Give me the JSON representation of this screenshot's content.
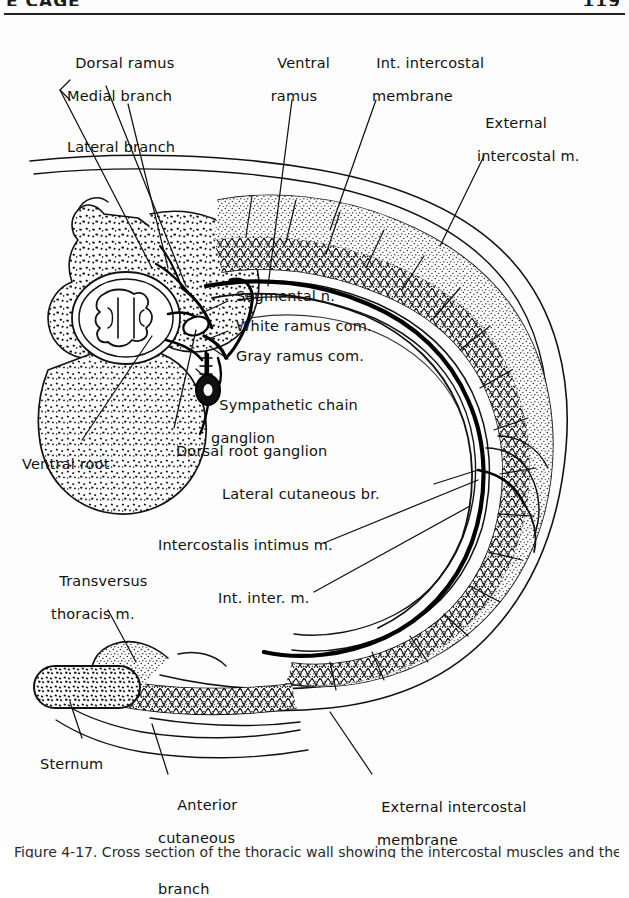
{
  "page": {
    "running_head_left": "E  CAGE",
    "running_head_right": "119",
    "caption": "Figure 4-17.  Cross section of the thoracic wall showing the intercostal muscles and the course of a typical intercostal nerve."
  },
  "figure": {
    "labels": [
      {
        "id": "dorsal-ramus",
        "text": "Dorsal ramus"
      },
      {
        "id": "medial-branch",
        "text": "Medial branch"
      },
      {
        "id": "lateral-branch",
        "text": "Lateral branch"
      },
      {
        "id": "ventral-ramus",
        "line1": "Ventral",
        "line2": "ramus"
      },
      {
        "id": "internal-intercostal-membrane",
        "line1": "Int. intercostal",
        "line2": "membrane"
      },
      {
        "id": "external-intercostal-muscle",
        "line1": "External",
        "line2": "intercostal m."
      },
      {
        "id": "segmental-nerve",
        "text": "Segmental n."
      },
      {
        "id": "white-ramus-communicans",
        "text": "White ramus com."
      },
      {
        "id": "gray-ramus-communicans",
        "text": "Gray ramus com."
      },
      {
        "id": "sympathetic-chain-ganglion",
        "line1": "Sympathetic chain",
        "line2": "ganglion"
      },
      {
        "id": "dorsal-root-ganglion",
        "text": "Dorsal root ganglion"
      },
      {
        "id": "ventral-root",
        "text": "Ventral root"
      },
      {
        "id": "lateral-cutaneous-branch",
        "text": "Lateral cutaneous br."
      },
      {
        "id": "intercostalis-intimus-muscle",
        "text": "Intercostalis intimus m."
      },
      {
        "id": "internal-intercostal-muscle",
        "text": "Int. inter. m."
      },
      {
        "id": "transversus-thoracis-muscle",
        "line1": "Transversus",
        "line2": "thoracis m."
      },
      {
        "id": "sternum",
        "text": "Sternum"
      },
      {
        "id": "anterior-cutaneous-branch",
        "line1": "Anterior",
        "line2": "cutaneous",
        "line3": "branch"
      },
      {
        "id": "external-intercostal-membrane",
        "line1": "External intercostal",
        "line2": "membrane"
      }
    ]
  }
}
